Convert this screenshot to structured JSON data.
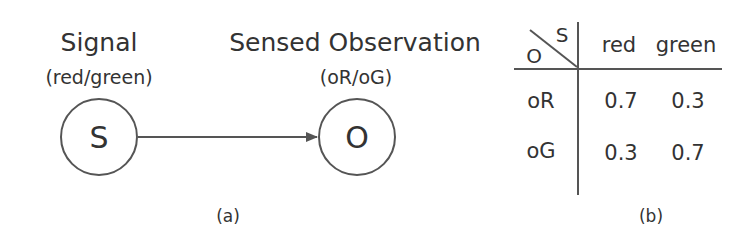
{
  "panel_a": {
    "caption": "(a)",
    "nodes": [
      {
        "id": "S",
        "label": "S",
        "title": "Signal",
        "subtitle": "(red/green)"
      },
      {
        "id": "O",
        "label": "O",
        "title": "Sensed Observation",
        "subtitle": "(oR/oG)"
      }
    ],
    "edges": [
      {
        "from": "S",
        "to": "O"
      }
    ]
  },
  "panel_b": {
    "caption": "(b)",
    "corner": {
      "column_var": "S",
      "row_var": "O"
    },
    "columns": [
      "red",
      "green"
    ],
    "rows": [
      {
        "label": "oR",
        "values": [
          "0.7",
          "0.3"
        ]
      },
      {
        "label": "oG",
        "values": [
          "0.3",
          "0.7"
        ]
      }
    ]
  },
  "colors": {
    "stroke": "#555555",
    "text": "#333333",
    "background": "#ffffff"
  }
}
